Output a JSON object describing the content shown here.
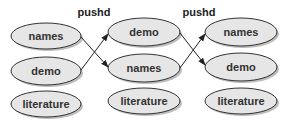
{
  "diagram": {
    "operations": [
      {
        "label": "pushd",
        "x": 94,
        "y": 16
      },
      {
        "label": "pushd",
        "x": 199,
        "y": 16
      }
    ],
    "stacks": [
      {
        "cx": 46,
        "items": [
          {
            "label": "names",
            "cy": 36
          },
          {
            "label": "demo",
            "cy": 71
          },
          {
            "label": "literature",
            "cy": 104
          }
        ]
      },
      {
        "cx": 144,
        "items": [
          {
            "label": "demo",
            "cy": 32
          },
          {
            "label": "names",
            "cy": 68
          },
          {
            "label": "literature",
            "cy": 101
          }
        ]
      },
      {
        "cx": 241,
        "items": [
          {
            "label": "names",
            "cy": 32
          },
          {
            "label": "demo",
            "cy": 67
          },
          {
            "label": "literature",
            "cy": 101
          }
        ]
      }
    ],
    "colors": {
      "ellipse_fill": "#e6e6e6",
      "ellipse_stroke": "#333333",
      "shadow": "#bdbdbd",
      "arrow": "#222222"
    }
  }
}
